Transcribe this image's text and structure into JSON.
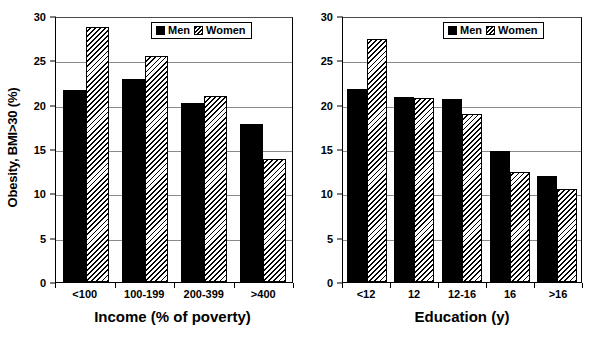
{
  "chart_data": [
    {
      "type": "bar",
      "panel": "left",
      "title": "",
      "xlabel": "Income (% of poverty)",
      "ylabel": "Obesity, BMI>30 (%)",
      "categories": [
        "<100",
        "100-199",
        "200-399",
        ">400"
      ],
      "series": [
        {
          "name": "Men",
          "values": [
            21.7,
            22.9,
            20.2,
            17.8
          ]
        },
        {
          "name": "Women",
          "values": [
            28.8,
            25.5,
            21.0,
            13.9
          ]
        }
      ],
      "ylim": [
        0,
        30
      ],
      "yticks": [
        0,
        5,
        10,
        15,
        20,
        25,
        30
      ],
      "grid": true,
      "legend_position": "top-right",
      "legend": [
        "Men",
        "Women"
      ]
    },
    {
      "type": "bar",
      "panel": "right",
      "title": "",
      "xlabel": "Education (y)",
      "ylabel": "",
      "categories": [
        "<12",
        "12",
        "12-16",
        "16",
        ">16"
      ],
      "series": [
        {
          "name": "Men",
          "values": [
            21.8,
            20.9,
            20.6,
            14.8,
            12.0
          ]
        },
        {
          "name": "Women",
          "values": [
            27.4,
            20.8,
            19.0,
            12.4,
            10.5
          ]
        }
      ],
      "ylim": [
        0,
        30
      ],
      "yticks": [
        0,
        5,
        10,
        15,
        20,
        25,
        30
      ],
      "grid": true,
      "legend_position": "top-right",
      "legend": [
        "Men",
        "Women"
      ]
    }
  ],
  "colors": {
    "men_fill": "#000000",
    "women_fill": "#000000",
    "women_hatch_background": "#ffffff",
    "axis": "#000000",
    "grid": "#8a8a8a",
    "background": "#ffffff"
  },
  "left_panel": {
    "ylabel": "Obesity, BMI>30 (%)",
    "xlabel": "Income (% of poverty)",
    "yticks": [
      "30",
      "25",
      "20",
      "15",
      "10",
      "5",
      "0"
    ],
    "xticks": [
      "<100",
      "100-199",
      "200-399",
      ">400"
    ],
    "legend": {
      "men_label": "Men",
      "women_label": "Women"
    }
  },
  "right_panel": {
    "ylabel": "",
    "xlabel": "Education (y)",
    "yticks": [
      "30",
      "25",
      "20",
      "15",
      "10",
      "5",
      "0"
    ],
    "xticks": [
      "<12",
      "12",
      "12-16",
      "16",
      ">16"
    ],
    "legend": {
      "men_label": "Men",
      "women_label": "Women"
    }
  }
}
